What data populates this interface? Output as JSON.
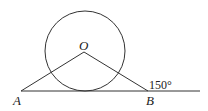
{
  "diagram": {
    "points": {
      "O": "O",
      "A": "A",
      "B": "B"
    },
    "angle_label": "150°",
    "elements": [
      "circle centered at O tangent to line AB",
      "segment OA",
      "segment OB",
      "line through A and B extended"
    ]
  }
}
